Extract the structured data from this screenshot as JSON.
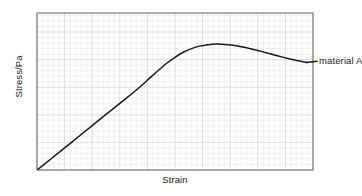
{
  "chart_data": {
    "type": "line",
    "title": "",
    "xlabel": "Strain",
    "ylabel": "Stress/Pa",
    "grid": true,
    "grid_minor": true,
    "legend_position": "inline-right-of-curve",
    "axis_ticks": false,
    "xlim": [
      0,
      1
    ],
    "ylim": [
      0,
      1
    ],
    "series": [
      {
        "name": "material A",
        "annotation": "material A",
        "color": "#1a1a1a",
        "points": [
          {
            "x": 0.0,
            "y": 0.0
          },
          {
            "x": 0.05,
            "y": 0.07
          },
          {
            "x": 0.1,
            "y": 0.141
          },
          {
            "x": 0.15,
            "y": 0.212
          },
          {
            "x": 0.2,
            "y": 0.283
          },
          {
            "x": 0.25,
            "y": 0.354
          },
          {
            "x": 0.3,
            "y": 0.424
          },
          {
            "x": 0.322,
            "y": 0.455
          },
          {
            "x": 0.35,
            "y": 0.495
          },
          {
            "x": 0.38,
            "y": 0.54
          },
          {
            "x": 0.41,
            "y": 0.588
          },
          {
            "x": 0.44,
            "y": 0.635
          },
          {
            "x": 0.47,
            "y": 0.68
          },
          {
            "x": 0.5,
            "y": 0.718
          },
          {
            "x": 0.53,
            "y": 0.75
          },
          {
            "x": 0.56,
            "y": 0.773
          },
          {
            "x": 0.59,
            "y": 0.789
          },
          {
            "x": 0.62,
            "y": 0.798
          },
          {
            "x": 0.65,
            "y": 0.802
          },
          {
            "x": 0.68,
            "y": 0.8
          },
          {
            "x": 0.71,
            "y": 0.794
          },
          {
            "x": 0.74,
            "y": 0.785
          },
          {
            "x": 0.77,
            "y": 0.774
          },
          {
            "x": 0.8,
            "y": 0.761
          },
          {
            "x": 0.83,
            "y": 0.747
          },
          {
            "x": 0.86,
            "y": 0.733
          },
          {
            "x": 0.89,
            "y": 0.719
          },
          {
            "x": 0.92,
            "y": 0.706
          },
          {
            "x": 0.95,
            "y": 0.694
          },
          {
            "x": 0.975,
            "y": 0.685
          }
        ],
        "features": {
          "elastic_region_end_x": 0.322,
          "peak_x": 0.65,
          "peak_y": 0.802,
          "origin": [
            0,
            0
          ]
        }
      }
    ],
    "colors": {
      "curve": "#1a1a1a",
      "frame": "#6e6e6e",
      "grid_minor": "#ebe7e5",
      "grid_major": "#dcd8d6",
      "background": "#ffffff",
      "text": "#1a1a1a"
    }
  }
}
